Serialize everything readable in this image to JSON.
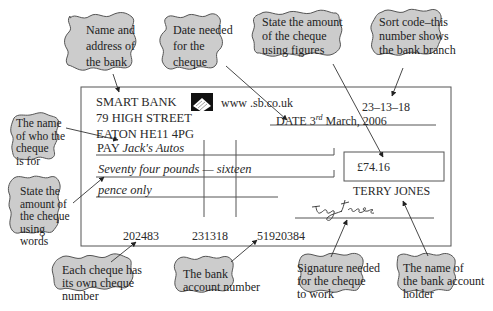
{
  "cheque": {
    "bank_name": "SMART BANK",
    "website": "www .sb.co.uk",
    "sort_code": "23–13–18",
    "address_line1": "79 HIGH STREET",
    "address_line2": "EATON HE11 4PG",
    "date_label": "DATE",
    "date_day": "3",
    "date_suffix": "rd",
    "date_rest": "March, 2006",
    "pay_label": "PAY",
    "payee": "Jack's Autos",
    "amount_words_line1": "Seventy four pounds — sixteen",
    "amount_words_line2": "pence only",
    "amount_figures": "£74.16",
    "account_holder": "TERRY JONES",
    "signature": "Terry Jones",
    "cheque_number": "202483",
    "sort_code_mica": "231318",
    "account_number": "51920384"
  },
  "callouts": {
    "bank_name_address": [
      "Name and",
      "address of",
      "the bank"
    ],
    "date": [
      "Date needed",
      "for the",
      "cheque"
    ],
    "amount_figures": [
      "State the amount",
      "of the cheque",
      "using figures"
    ],
    "sort_code": [
      "Sort code–this",
      "number shows",
      "the bank branch"
    ],
    "payee": [
      "The name",
      "of who the",
      "cheque",
      "is for"
    ],
    "amount_words": [
      "State the",
      "amount of",
      "the cheque",
      "using",
      "words"
    ],
    "cheque_number": [
      "Each cheque has",
      "its own cheque",
      "number"
    ],
    "account_number": [
      "The bank",
      "account number"
    ],
    "signature": [
      "Signature needed",
      "for the cheque",
      "to work"
    ],
    "account_holder": [
      "The name of",
      "the bank account",
      "holder"
    ]
  },
  "colors": {
    "callout_fill": "#cccccc",
    "callout_stroke": "#555555",
    "line": "#444444",
    "background": "#ffffff"
  }
}
